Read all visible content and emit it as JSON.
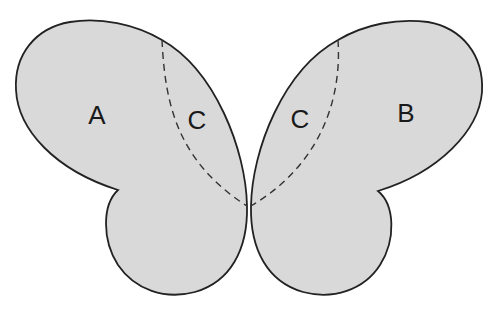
{
  "diagram": {
    "type": "butterfly-regions",
    "fill_color": "#d9d9d9",
    "stroke_color": "#222222",
    "labels": {
      "left_outer": "A",
      "left_inner": "C",
      "right_inner": "C",
      "right_outer": "B"
    }
  }
}
